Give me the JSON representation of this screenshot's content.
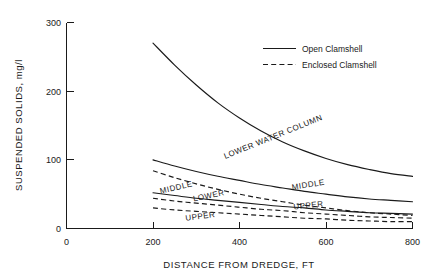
{
  "chart_data": {
    "type": "line",
    "title": "",
    "xlabel": "DISTANCE FROM DREDGE, FT",
    "ylabel": "SUSPENDED SOLIDS, mg/l",
    "xlim": [
      0,
      800
    ],
    "ylim": [
      0,
      300
    ],
    "xticks": [
      0,
      200,
      400,
      600,
      800
    ],
    "yticks": [
      0,
      100,
      200,
      300
    ],
    "xtick_labels": [
      "0",
      "200",
      "400",
      "600",
      "800"
    ],
    "ytick_labels": [
      "0",
      "100",
      "200",
      "300"
    ],
    "grid": false,
    "legend": {
      "position": "upper-right-inside",
      "entries": [
        {
          "label": "Open Clamshell",
          "style": "solid"
        },
        {
          "label": "Enclosed Clamshell",
          "style": "dashed"
        }
      ]
    },
    "annotations": [
      {
        "text": "LOWER WATER COLUMN",
        "x": 480,
        "y": 130,
        "rotation": -22
      },
      {
        "text": "MIDDLE",
        "x": 560,
        "y": 60,
        "rotation": -9
      },
      {
        "text": "UPPER",
        "x": 560,
        "y": 30,
        "rotation": -6
      },
      {
        "text": "MIDDLE",
        "x": 255,
        "y": 56,
        "rotation": -13
      },
      {
        "text": "LOWER",
        "x": 330,
        "y": 44,
        "rotation": -12
      },
      {
        "text": "UPPER",
        "x": 310,
        "y": 14,
        "rotation": -7
      }
    ],
    "series": [
      {
        "name": "Open Clamshell - Lower Water Column",
        "style": "solid",
        "label": "LOWER WATER COLUMN",
        "x": [
          200,
          250,
          300,
          350,
          400,
          450,
          500,
          550,
          600,
          650,
          700,
          750,
          800
        ],
        "y": [
          270,
          238,
          209,
          183,
          161,
          142,
          126,
          113,
          102,
          93,
          86,
          80,
          76
        ]
      },
      {
        "name": "Open Clamshell - Middle",
        "style": "solid",
        "label": "MIDDLE",
        "x": [
          200,
          250,
          300,
          350,
          400,
          450,
          500,
          550,
          600,
          650,
          700,
          750,
          800
        ],
        "y": [
          100,
          91,
          83,
          76,
          70,
          64,
          59,
          54,
          50,
          46,
          43,
          41,
          39
        ]
      },
      {
        "name": "Open Clamshell - Upper",
        "style": "solid",
        "label": "UPPER",
        "x": [
          200,
          250,
          300,
          350,
          400,
          450,
          500,
          550,
          600,
          650,
          700,
          750,
          800
        ],
        "y": [
          52,
          48,
          44,
          41,
          38,
          35,
          32,
          30,
          27,
          25,
          23,
          22,
          21
        ]
      },
      {
        "name": "Enclosed Clamshell - Lower Water Column",
        "style": "dashed",
        "label": "LOWER",
        "x": [
          200,
          250,
          300,
          350,
          400,
          450,
          500,
          550,
          600,
          650,
          700,
          750,
          800
        ],
        "y": [
          84,
          74,
          65,
          57,
          50,
          44,
          39,
          34,
          30,
          26,
          23,
          21,
          19
        ]
      },
      {
        "name": "Enclosed Clamshell - Middle",
        "style": "dashed",
        "label": "MIDDLE",
        "x": [
          200,
          250,
          300,
          350,
          400,
          450,
          500,
          550,
          600,
          650,
          700,
          750,
          800
        ],
        "y": [
          44,
          40,
          37,
          34,
          31,
          28,
          26,
          23,
          21,
          19,
          17,
          16,
          15
        ]
      },
      {
        "name": "Enclosed Clamshell - Upper",
        "style": "dashed",
        "label": "UPPER",
        "x": [
          200,
          250,
          300,
          350,
          400,
          450,
          500,
          550,
          600,
          650,
          700,
          750,
          800
        ],
        "y": [
          30,
          27,
          25,
          23,
          21,
          19,
          17,
          15,
          14,
          12,
          11,
          10,
          10
        ]
      }
    ]
  }
}
